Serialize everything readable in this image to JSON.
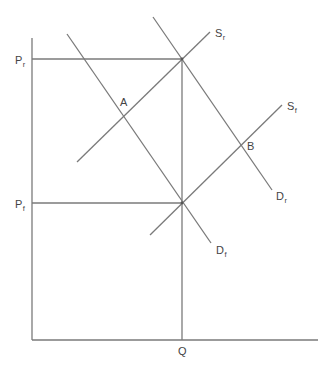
{
  "diagram": {
    "type": "supply-demand",
    "line_color": "#7a7a7a",
    "text_color": "#444444",
    "axes": {
      "origin": [
        32,
        340
      ],
      "y_axis_top": [
        32,
        38
      ],
      "x_axis_right": [
        318,
        340
      ],
      "x_label": {
        "main": "Q",
        "sub": "",
        "pos": [
          183,
          354
        ]
      }
    },
    "price_levels": [
      {
        "id": "Pr",
        "main": "P",
        "sub": "r",
        "y": 59,
        "x_end": 182,
        "pos": [
          17,
          63
        ]
      },
      {
        "id": "Pf",
        "main": "P",
        "sub": "f",
        "y": 203,
        "x_end": 182,
        "pos": [
          17,
          207
        ]
      }
    ],
    "quantity_line": {
      "x": 182,
      "y_top": 59,
      "y_bottom": 340
    },
    "curves": [
      {
        "id": "Dr",
        "main": "D",
        "sub": "r",
        "from": [
          153,
          17
        ],
        "to": [
          272,
          190
        ],
        "label_pos": [
          277,
          200
        ]
      },
      {
        "id": "Df",
        "main": "D",
        "sub": "f",
        "from": [
          67,
          34
        ],
        "to": [
          211,
          243
        ],
        "label_pos": [
          216,
          254
        ]
      },
      {
        "id": "Sr",
        "main": "S",
        "sub": "r",
        "from": [
          77,
          162
        ],
        "to": [
          210,
          32
        ],
        "label_pos": [
          216,
          37
        ]
      },
      {
        "id": "Sf",
        "main": "S",
        "sub": "f",
        "from": [
          150,
          235
        ],
        "to": [
          282,
          105
        ],
        "label_pos": [
          288,
          111
        ]
      }
    ],
    "points": [
      {
        "id": "A",
        "label": "A",
        "at": [
          123,
          117
        ],
        "label_pos": [
          119,
          106
        ]
      },
      {
        "id": "B",
        "label": "B",
        "at": [
          241,
          144
        ],
        "label_pos": [
          247,
          150
        ]
      }
    ],
    "labels": {
      "Pr_main": "P",
      "Pr_sub": "r",
      "Pf_main": "P",
      "Pf_sub": "f",
      "Q": "Q",
      "A": "A",
      "B": "B",
      "Dr_main": "D",
      "Dr_sub": "r",
      "Df_main": "D",
      "Df_sub": "f",
      "Sr_main": "S",
      "Sr_sub": "r",
      "Sf_main": "S",
      "Sf_sub": "f"
    }
  }
}
